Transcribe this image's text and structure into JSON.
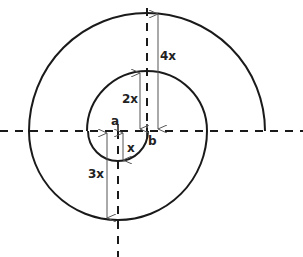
{
  "diagram": {
    "type": "spiral-construction",
    "labels": {
      "a": "a",
      "b": "b",
      "x": "x",
      "two_x": "2x",
      "three_x": "3x",
      "four_x": "4x"
    },
    "colors": {
      "stroke": "#1a1a1a",
      "arrow": "#555555",
      "background": "#ffffff"
    }
  }
}
